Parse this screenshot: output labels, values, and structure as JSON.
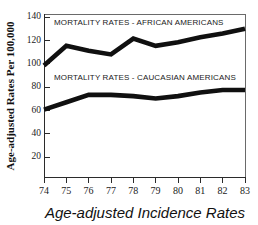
{
  "chart_data": {
    "type": "line",
    "title": "",
    "subtitle": "",
    "xlabel": "Age-adjusted Incidence Rates",
    "ylabel": "Age-adjusted Rates Per 100,000",
    "x": [
      74,
      75,
      76,
      77,
      78,
      79,
      80,
      81,
      82,
      83
    ],
    "xtick_labels": [
      "74",
      "75",
      "76",
      "77",
      "78",
      "79",
      "80",
      "81",
      "82",
      "83"
    ],
    "ytick_labels": [
      "20",
      "40",
      "60",
      "80",
      "100",
      "120",
      "140"
    ],
    "ytick_values": [
      20,
      40,
      60,
      80,
      100,
      120,
      140
    ],
    "ylim": [
      10,
      143
    ],
    "xlim": [
      74,
      83
    ],
    "grid": false,
    "legend_position": "inline-annotation",
    "series": [
      {
        "name": "MORTALITY RATES - AFRICAN AMERICANS",
        "annotation": "MORTALITY RATES - AFRICAN AMERICANS",
        "color": "#101010",
        "values": [
          101,
          117,
          113,
          110,
          123,
          117,
          120,
          124,
          127,
          131
        ]
      },
      {
        "name": "MORTALITY RATES - CAUCASIAN AMERICANS",
        "annotation": "MORTALITY RATES - CAUCASIAN AMERICANS",
        "color": "#101010",
        "values": [
          65,
          71,
          77,
          77,
          76,
          74,
          76,
          79,
          81,
          81
        ]
      }
    ],
    "annotations": [
      {
        "text": "MORTALITY RATES - AFRICAN AMERICANS",
        "x_px": 54,
        "y_px": 25
      },
      {
        "text": "MORTALITY RATES - CAUCASIAN AMERICANS",
        "x_px": 54,
        "y_px": 80
      }
    ]
  }
}
